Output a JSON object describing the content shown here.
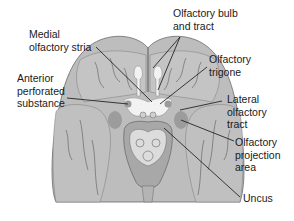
{
  "figure": {
    "view": "Inferior (ventral) view of the brain",
    "colors": {
      "background": "#ffffff",
      "cortex": "#b9b9b9",
      "cortex_light": "#c8c8c8",
      "sulcus": "#5a5a5a",
      "olfactory_white": "#f2f2f2",
      "projection_area": "#9a9a9a",
      "brainstem": "#d8d8d8",
      "leader_line": "#111111",
      "label_text": "#1a1a1a"
    }
  },
  "labels": [
    {
      "id": "medial-olfactory-stria",
      "lines": [
        "Medial",
        "olfactory stria"
      ]
    },
    {
      "id": "olfactory-bulb-and-tract",
      "lines": [
        "Olfactory bulb",
        "and tract"
      ]
    },
    {
      "id": "olfactory-trigone",
      "lines": [
        "Olfactory",
        "trigone"
      ]
    },
    {
      "id": "anterior-perforated-substance",
      "lines": [
        "Anterior",
        "perforated",
        "substance"
      ]
    },
    {
      "id": "lateral-olfactory-tract",
      "lines": [
        "Lateral",
        "olfactory",
        "tract"
      ]
    },
    {
      "id": "olfactory-projection-area",
      "lines": [
        "Olfactory",
        "projection",
        "area"
      ]
    },
    {
      "id": "uncus",
      "lines": [
        "Uncus"
      ]
    }
  ]
}
